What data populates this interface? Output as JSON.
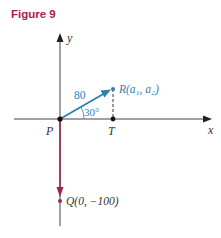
{
  "figure": {
    "title": "Figure 9"
  },
  "axes": {
    "x_label": "x",
    "y_label": "y"
  },
  "points": {
    "P": {
      "label": "P"
    },
    "T": {
      "label": "T"
    },
    "R": {
      "label": "R(a₁, a₂)"
    },
    "Q": {
      "label": "Q(0, −100)"
    }
  },
  "vector_PR": {
    "magnitude_label": "80",
    "angle_label": "30°",
    "color": "#2f7fb0"
  },
  "vector_PQ": {
    "color": "#a3224a"
  },
  "colors": {
    "axis": "#333333",
    "blue": "#2f7fb0",
    "red": "#a3224a",
    "text": "#333333"
  }
}
